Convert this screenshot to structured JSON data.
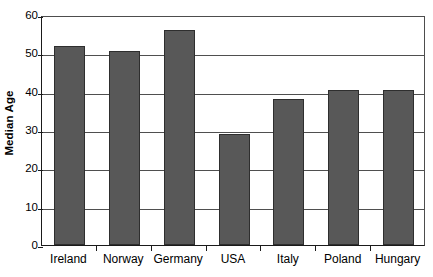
{
  "chart_data": {
    "type": "bar",
    "title": "",
    "subtitle": "",
    "xlabel": "",
    "ylabel": "Median Age",
    "categories": [
      "Ireland",
      "Norway",
      "Germany",
      "USA",
      "Italy",
      "Poland",
      "Hungary"
    ],
    "values": [
      52,
      50.5,
      56,
      29,
      38,
      40.5,
      40.5
    ],
    "ylim": [
      0,
      60
    ],
    "ytick_values": [
      0,
      10,
      20,
      30,
      40,
      50,
      60
    ],
    "ytick_labels": [
      "0",
      "10",
      "20",
      "30",
      "40",
      "50",
      "60"
    ],
    "grid": true,
    "grid_axis": "y",
    "legend": false,
    "legend_position": "none",
    "annotations": [],
    "series": [
      {
        "name": "Median Age",
        "values": [
          52,
          50.5,
          56,
          29,
          38,
          40.5,
          40.5
        ],
        "color": "#585858"
      }
    ],
    "colors": {
      "bar_fill": "#585858",
      "bar_edge": "#2e2e2e",
      "gridline": "#4f4f4f",
      "axis": "#1a1a1a",
      "background": "#ffffff",
      "text": "#000000"
    }
  }
}
